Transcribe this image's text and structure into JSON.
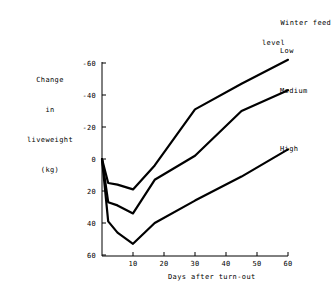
{
  "legend": {
    "title_line1": "Winter feed",
    "title_line2": "level",
    "entries": [
      {
        "name": "Low",
        "label": "Low"
      },
      {
        "name": "Medium",
        "label": "Medium"
      },
      {
        "name": "High",
        "label": "High"
      }
    ]
  },
  "axes": {
    "y_title_lines": [
      "Change",
      "in",
      "liveweight",
      "(kg)"
    ],
    "x_title": "Days after turn-out",
    "y_ticks": [
      "60",
      "40",
      "20",
      "0",
      "-20",
      "-40",
      "-60"
    ],
    "x_ticks": [
      "10",
      "20",
      "30",
      "40",
      "50",
      "60"
    ]
  },
  "colors": {
    "line": "#000000",
    "axis": "#000000",
    "background": "#ffffff"
  },
  "chart_data": {
    "type": "line",
    "title": "",
    "subtitle": "",
    "xlabel": "Days after turn-out",
    "ylabel": "Change in liveweight (kg)",
    "xlim": [
      0,
      60
    ],
    "ylim": [
      -60,
      60
    ],
    "xticks": [
      10,
      20,
      30,
      40,
      50,
      60
    ],
    "yticks": [
      -60,
      -40,
      -20,
      0,
      20,
      40,
      60
    ],
    "grid": false,
    "legend": "Winter feed level",
    "legend_position": "right-of-lines",
    "series": [
      {
        "name": "Low",
        "x": [
          0,
          2,
          5,
          10,
          17,
          30,
          45,
          60
        ],
        "y": [
          0,
          -15,
          -16,
          -19,
          -4,
          31,
          47,
          62
        ]
      },
      {
        "name": "Medium",
        "x": [
          0,
          2,
          5,
          10,
          17,
          30,
          45,
          60
        ],
        "y": [
          0,
          -27,
          -29,
          -34,
          -13,
          2,
          30,
          43
        ]
      },
      {
        "name": "High",
        "x": [
          0,
          2,
          5,
          10,
          17,
          30,
          45,
          60
        ],
        "y": [
          0,
          -39,
          -46,
          -53,
          -40,
          -26,
          -11,
          6
        ]
      }
    ]
  }
}
